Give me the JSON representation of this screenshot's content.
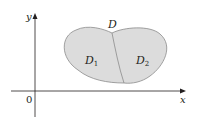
{
  "diagram": {
    "axes": {
      "x_label": "x",
      "y_label": "y",
      "origin_label": "0"
    },
    "region": {
      "label": "D",
      "subregions": [
        {
          "label": "D",
          "subscript": "1"
        },
        {
          "label": "D",
          "subscript": "2"
        }
      ]
    },
    "colors": {
      "axis": "#231f20",
      "region_fill": "#dcdcdc",
      "region_stroke": "#8c8c8c",
      "text": "#231f20"
    }
  }
}
